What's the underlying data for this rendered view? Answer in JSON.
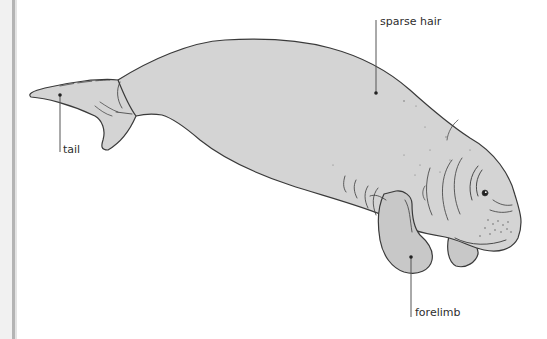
{
  "diagram": {
    "colors": {
      "body_fill": "#d4d4d4",
      "flipper_fill": "#c8c8c8",
      "outline": "#3a3a3a",
      "leader_line": "#555555",
      "label_text": "#2e2e2e"
    },
    "labels": [
      {
        "id": "sparse-hair",
        "text": "sparse hair",
        "dot": [
          376,
          93
        ],
        "line_top": 20
      },
      {
        "id": "tail",
        "text": "tail",
        "dot": [
          60,
          95
        ],
        "line_bottom": 152
      },
      {
        "id": "forelimb",
        "text": "forelimb",
        "dot": [
          411,
          257
        ],
        "line_bottom": 317
      }
    ]
  }
}
